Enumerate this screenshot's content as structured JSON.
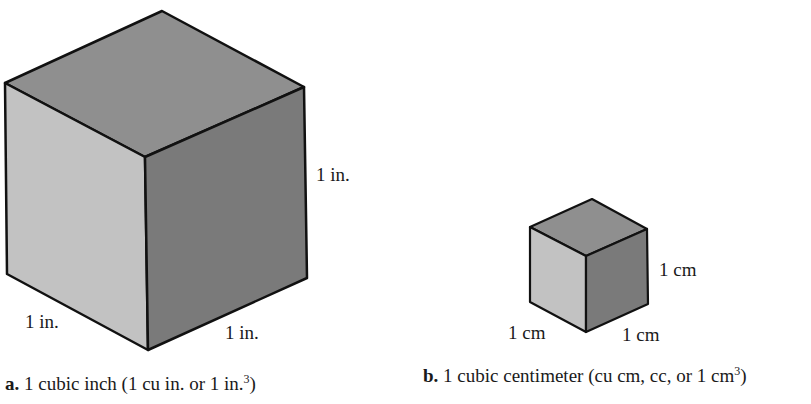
{
  "figure_a": {
    "dimension_labels": {
      "height": "1 in.",
      "left_depth": "1 in.",
      "right_width": "1 in."
    },
    "caption": {
      "letter": "a.",
      "text": "1 cubic inch (1 cu in. or 1 in.",
      "superscript": "3",
      "close": ")"
    }
  },
  "figure_b": {
    "dimension_labels": {
      "height": "1 cm",
      "left_depth": "1 cm",
      "right_width": "1 cm"
    },
    "caption": {
      "letter": "b.",
      "text": "1 cubic centimeter (cu cm, cc, or 1 cm",
      "superscript": "3",
      "close": ")"
    }
  },
  "colors": {
    "top_face": "#8f8f8f",
    "left_face": "#c2c2c2",
    "right_face": "#7a7a7a",
    "edge": "#111111"
  }
}
